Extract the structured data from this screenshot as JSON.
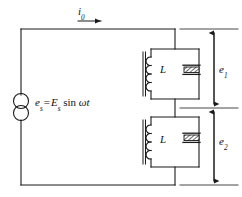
{
  "diagram": {
    "type": "electrical-schematic",
    "stroke_color": "#1a1a1a",
    "background_color": "#ffffff",
    "labels": {
      "current": {
        "symbol": "i",
        "subscript": "0",
        "text": "i0"
      },
      "source": {
        "lhs_symbol": "e",
        "lhs_subscript": "s",
        "equals": "=",
        "amplitude_symbol": "E",
        "amplitude_subscript": "s",
        "function": "sin",
        "argument": "ωt",
        "text": "es = Es sin ωt"
      },
      "inductor_top": "L",
      "inductor_bottom": "L",
      "voltage_top": {
        "symbol": "e",
        "subscript": "1",
        "text": "e1"
      },
      "voltage_bottom": {
        "symbol": "e",
        "subscript": "2",
        "text": "e2"
      }
    },
    "components": [
      {
        "name": "ac-source",
        "symbol": "double-circle",
        "label": "es = Es sin ωt"
      },
      {
        "name": "inductor-top",
        "symbol": "coil-with-core",
        "label": "L",
        "turns": 4
      },
      {
        "name": "capacitor-top",
        "symbol": "hatched-bar",
        "label": ""
      },
      {
        "name": "inductor-bottom",
        "symbol": "coil-with-core",
        "label": "L",
        "turns": 4
      },
      {
        "name": "capacitor-bottom",
        "symbol": "hatched-bar",
        "label": ""
      }
    ],
    "annotations": [
      {
        "name": "current-arrow",
        "direction": "right",
        "label": "i0"
      },
      {
        "name": "dimension-e1",
        "style": "double-headed-arrow",
        "label": "e1"
      },
      {
        "name": "dimension-e2",
        "style": "double-headed-arrow",
        "label": "e2"
      }
    ]
  }
}
